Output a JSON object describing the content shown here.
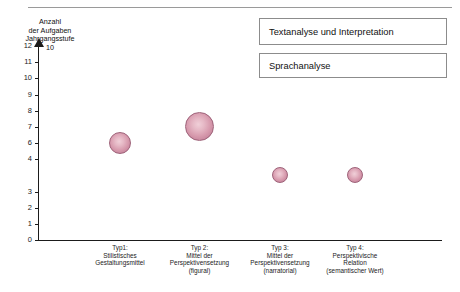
{
  "chart_data": {
    "type": "bubble",
    "title": "",
    "xlabel": "",
    "ylabel": "Anzahl der Aufgaben Jahrgangsstufe 10",
    "ylabel_lines": [
      "Anzahl",
      "der Aufgaben",
      "Jahrgangsstufe",
      "10"
    ],
    "ylim": [
      0,
      12
    ],
    "ytick_labels": [
      "12",
      "11",
      "10",
      "9",
      "8",
      "7",
      "6",
      "4",
      "3",
      "2",
      "1",
      "0"
    ],
    "ytick_values": [
      12,
      11,
      10,
      9,
      8,
      7,
      6,
      5,
      3,
      2,
      1,
      0
    ],
    "grid": false,
    "legend_position": "top-right",
    "categories": [
      "Typ1: Stilistisches Gestaltungsmittel",
      "Typ 2: Mittel der Perspektivensetzung (figural)",
      "Typ 3: Mittel der Perspektivensetzung (narratorial)",
      "Typ 4: Perspektivische Relation (semantischer Wert)"
    ],
    "category_lines": [
      [
        "Typ1:",
        "Stilistisches",
        "Gestaltungsmittel"
      ],
      [
        "Typ 2:",
        "Mittel der",
        "Perspektivensetzung",
        "(figural)"
      ],
      [
        "Typ 3:",
        "Mittel der",
        "Perspektivensetzung",
        "(narratorial)"
      ],
      [
        "Typ 4:",
        "Perspektivische",
        "Relation",
        "(semantischer Wert)"
      ]
    ],
    "values": [
      6,
      7,
      4,
      4
    ],
    "sizes": [
      22,
      29,
      16,
      16
    ],
    "series": [
      {
        "name": "Sprachanalyse",
        "points": [
          {
            "x": 0,
            "y": 6,
            "size": 22
          },
          {
            "x": 1,
            "y": 7,
            "size": 29
          },
          {
            "x": 2,
            "y": 4,
            "size": 16
          },
          {
            "x": 3,
            "y": 4,
            "size": 16
          }
        ]
      }
    ],
    "bubble_color": "#d79aad",
    "bubble_edge_color": "#9e6279",
    "axis_color": "#1b1b1b"
  },
  "legend": {
    "items": [
      {
        "label": "Textanalyse und Interpretation"
      },
      {
        "label": "Sprachanalyse"
      }
    ]
  }
}
